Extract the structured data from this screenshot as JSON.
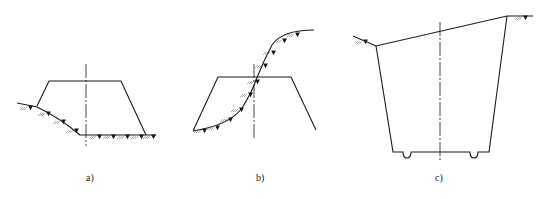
{
  "figure": {
    "panels": [
      {
        "id": "a",
        "label": "a)",
        "description": "Embankment section on a sloping-to-level ground"
      },
      {
        "id": "b",
        "label": "b)",
        "description": "Half-fill half-cut section on S-shaped hillside"
      },
      {
        "id": "c",
        "label": "c)",
        "description": "Cutting section with side ditches on inclined ground"
      }
    ],
    "colors": {
      "line": "#1a1a1a",
      "hatch": "#555555",
      "background": "#ffffff"
    }
  }
}
